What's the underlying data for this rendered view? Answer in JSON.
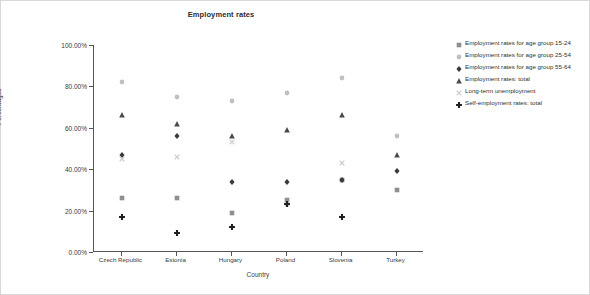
{
  "chart_data": {
    "type": "scatter",
    "title": "Employment rates",
    "xlabel": "Country",
    "ylabel": "Percentages",
    "categories": [
      "Czech Republic",
      "Estonia",
      "Hungary",
      "Poland",
      "Slovenia",
      "Turkey"
    ],
    "ylim": [
      0,
      100
    ],
    "ytick_labels": [
      "0.00%",
      "20.00%",
      "40.00%",
      "60.00%",
      "80.00%",
      "100.00%"
    ],
    "ytick_values": [
      0,
      20,
      40,
      60,
      80,
      100
    ],
    "grid": false,
    "legend_position": "right",
    "series": [
      {
        "name": "Employment rates for age group 15-24",
        "marker": "square",
        "color": "#8f8f8f",
        "values": [
          26.0,
          26.0,
          19.0,
          25.0,
          35.0,
          30.0
        ]
      },
      {
        "name": "Employment rates for age group 25-54",
        "marker": "circle",
        "color": "#c0c0c0",
        "values": [
          82.0,
          75.0,
          73.0,
          77.0,
          84.0,
          56.0
        ]
      },
      {
        "name": "Employment rates for age group 55-64",
        "marker": "diamond",
        "color": "#3a3a3a",
        "values": [
          47.0,
          56.0,
          34.0,
          34.0,
          35.0,
          39.0
        ]
      },
      {
        "name": "Employment rates: total",
        "marker": "triangle",
        "color": "#4a4a4a",
        "values": [
          66.0,
          62.0,
          56.0,
          59.0,
          66.0,
          47.0
        ]
      },
      {
        "name": "Long-term unemployment",
        "marker": "x",
        "color": "#cfcfcf",
        "values": [
          45.0,
          46.0,
          53.0,
          23.0,
          43.0,
          null
        ]
      },
      {
        "name": "Self-employment rates: total",
        "marker": "plus",
        "color": "#1f1f1f",
        "values": [
          17.0,
          9.0,
          12.0,
          23.0,
          17.0,
          null
        ]
      }
    ]
  }
}
